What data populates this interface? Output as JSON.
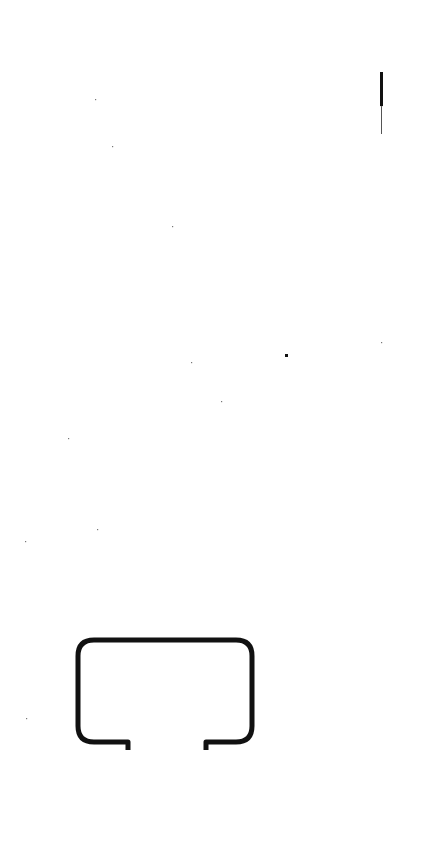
{
  "page": {
    "background": "#ffffff",
    "ink_color": "#111111"
  },
  "diagram": {
    "type": "cross-section-profile",
    "profile": {
      "x": 78,
      "y": 640,
      "width": 174,
      "height": 102,
      "corner_radius": 16,
      "stroke_width": 5,
      "opening_left_x": 128,
      "opening_right_x": 206,
      "lip_depth": 8
    },
    "edge_mark": {
      "x": 381,
      "y": 72,
      "height": 62
    },
    "specks": [
      [
        95,
        99
      ],
      [
        112,
        146
      ],
      [
        172,
        226
      ],
      [
        285,
        354
      ],
      [
        191,
        362
      ],
      [
        221,
        401
      ],
      [
        68,
        438
      ],
      [
        97,
        529
      ],
      [
        25,
        541
      ],
      [
        381,
        342
      ],
      [
        26,
        718
      ]
    ]
  }
}
